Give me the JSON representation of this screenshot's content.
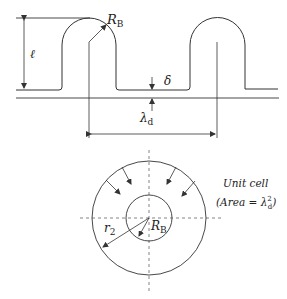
{
  "top_diagram": {
    "labels": {
      "length": "ℓ",
      "bubble_radius": "R",
      "bubble_radius_sub": "B",
      "gap": "δ",
      "spacing": "λ",
      "spacing_sub": "d"
    }
  },
  "bottom_diagram": {
    "labels": {
      "outer_radius": "r",
      "outer_radius_sub": "2",
      "inner_radius": "R",
      "inner_radius_sub": "B",
      "unit_cell_title": "Unit cell",
      "area_open": "(Area = λ",
      "area_sup": "2",
      "area_sub": "d",
      "area_close": ")"
    }
  },
  "colors": {
    "stroke": "#333333",
    "dashed": "#666666",
    "background": "#ffffff"
  }
}
